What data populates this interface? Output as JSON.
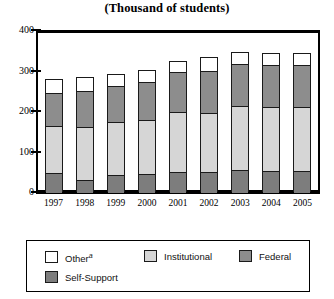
{
  "chart_data": {
    "type": "bar",
    "subtype": "stacked-vertical",
    "title": "(Thousand of students)",
    "xlabel": "",
    "ylabel": "",
    "ylim": [
      0,
      400
    ],
    "yticks": [
      0,
      100,
      200,
      300,
      400
    ],
    "ytick_labels": [
      "0",
      "100",
      "200",
      "300",
      "400"
    ],
    "grid": false,
    "legend_position": "bottom",
    "categories": [
      "1997",
      "1998",
      "1999",
      "2000",
      "2001",
      "2002",
      "2003",
      "2004",
      "2005"
    ],
    "stack_order_bottom_to_top": [
      "Self-Support",
      "Institutional",
      "Federal",
      "Other"
    ],
    "series": [
      {
        "name": "Self-Support",
        "color": "#7d7d7d",
        "values": [
          48,
          30,
          43,
          45,
          50,
          50,
          55,
          53,
          53
        ]
      },
      {
        "name": "Institutional",
        "color": "#d6d6d6",
        "values": [
          115,
          130,
          130,
          132,
          148,
          145,
          158,
          158,
          158
        ]
      },
      {
        "name": "Federal",
        "color": "#8d8d8d",
        "values": [
          82,
          90,
          88,
          95,
          98,
          103,
          103,
          103,
          103
        ]
      },
      {
        "name": "Other",
        "color": "#ffffff",
        "values": [
          35,
          35,
          30,
          30,
          28,
          35,
          30,
          30,
          30
        ]
      }
    ],
    "totals": [
      280,
      285,
      291,
      302,
      324,
      333,
      346,
      344,
      344
    ],
    "legend_entries": [
      {
        "label": "Other",
        "superscript": "a",
        "color": "#ffffff"
      },
      {
        "label": "Institutional",
        "superscript": "",
        "color": "#d6d6d6"
      },
      {
        "label": "Federal",
        "superscript": "",
        "color": "#8d8d8d"
      },
      {
        "label": "Self-Support",
        "superscript": "",
        "color": "#7d7d7d"
      }
    ]
  },
  "colors": {
    "axis": "#000000",
    "bar_outline": "#1a1a1a",
    "background": "#ffffff"
  }
}
